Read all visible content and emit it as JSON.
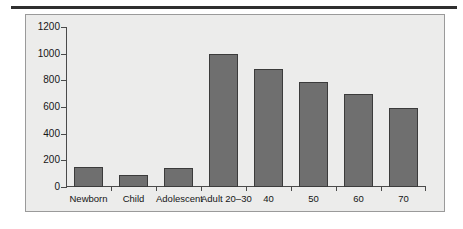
{
  "figure": {
    "background_color": "#ececeb",
    "frame_color": "#9a9a9a",
    "rule_color": "#2f2f2f"
  },
  "chart_data": {
    "type": "bar",
    "title": "",
    "subtitle": "",
    "xlabel": "",
    "ylabel": "",
    "categories": [
      "Newborn",
      "Child",
      "Adolescent",
      "Adult 20–30",
      "40",
      "50",
      "60",
      "70"
    ],
    "values": [
      150,
      90,
      145,
      1000,
      885,
      790,
      700,
      595
    ],
    "ylim": [
      0,
      1200
    ],
    "yticks": [
      0,
      200,
      400,
      600,
      800,
      1000,
      1200
    ],
    "ytick_labels": [
      "0",
      "200",
      "400",
      "600",
      "800",
      "1000",
      "1200"
    ],
    "grid": false,
    "legend": null,
    "bar_color": "#6f6f6f",
    "bar_edge_color": "#3b3b3b"
  }
}
